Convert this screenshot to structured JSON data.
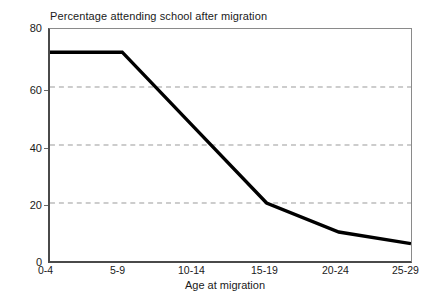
{
  "chart_data": {
    "type": "line",
    "title": "Percentage attending school after migration",
    "xlabel": "Age at migration",
    "ylabel": "",
    "categories": [
      "0-4",
      "5-9",
      "10-14",
      "15-19",
      "20-24",
      "25-29"
    ],
    "values": [
      72,
      72,
      46,
      20,
      10,
      6
    ],
    "series": [
      {
        "name": "Percentage attending school after migration",
        "values": [
          72,
          72,
          46,
          20,
          10,
          6
        ]
      }
    ],
    "ylim": [
      0,
      80
    ],
    "y_ticks": [
      0,
      20,
      40,
      60,
      80
    ],
    "y_tick_labels": [
      "0",
      "20",
      "40",
      "60",
      "80"
    ],
    "x_tick_labels": [
      "0-4",
      "5-9",
      "10-14",
      "15-19",
      "20-24",
      "25-29"
    ],
    "grid": "horizontal-dashed",
    "gridlines_at": [
      20,
      40,
      60
    ],
    "legend": "none",
    "line_color": "#000000",
    "grid_color": "#999999",
    "axis_color": "#4a4a4a",
    "background_color": "#ffffff"
  },
  "axes": {
    "y": {
      "ticks": [
        {
          "label": "80",
          "value": 80
        },
        {
          "label": "60",
          "value": 60
        },
        {
          "label": "40",
          "value": 40
        },
        {
          "label": "20",
          "value": 20
        },
        {
          "label": "0",
          "value": 0
        }
      ]
    },
    "x": {
      "title": "Age at migration",
      "ticks": [
        {
          "label": "0-4"
        },
        {
          "label": "5-9"
        },
        {
          "label": "10-14"
        },
        {
          "label": "15-19"
        },
        {
          "label": "20-24"
        },
        {
          "label": "25-29"
        }
      ]
    }
  }
}
